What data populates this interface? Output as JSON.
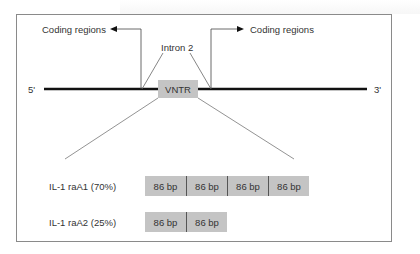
{
  "diagram": {
    "labels": {
      "coding_left": "Coding regions",
      "coding_right": "Coding regions",
      "intron": "Intron 2",
      "five_prime": "5'",
      "three_prime": "3'",
      "vntr": "VNTR"
    },
    "alleles": [
      {
        "name": "IL-1 raA1 (70%)",
        "repeats": [
          "86 bp",
          "86 bp",
          "86 bp",
          "86 bp"
        ]
      },
      {
        "name": "IL-1 raA2 (25%)",
        "repeats": [
          "86 bp",
          "86 bp"
        ]
      }
    ],
    "colors": {
      "box_fill": "#c4c4c4",
      "line": "#111111",
      "thin_line": "#777777",
      "text": "#333333"
    }
  }
}
